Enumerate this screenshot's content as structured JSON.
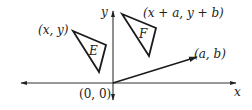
{
  "diagram": {
    "axes": {
      "x_label": "x",
      "y_label": "y",
      "origin_label": "(0, 0)"
    },
    "triangles": [
      {
        "name": "E",
        "vertex_label": "(x, y)"
      },
      {
        "name": "F",
        "vertex_label": "(x + a, y + b)"
      }
    ],
    "vector": {
      "label": "(a, b)"
    },
    "colors": {
      "stroke": "#1a1a1a",
      "axis": "#333333",
      "background": "#ffffff"
    }
  }
}
